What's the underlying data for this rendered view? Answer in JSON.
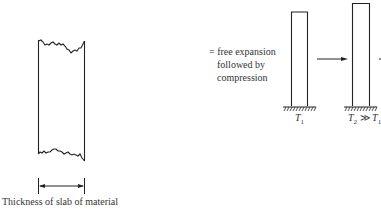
{
  "figure": {
    "slab_caption": "Thickness of slab of material",
    "description_lines": [
      "= free expansion",
      "followed by",
      "compression"
    ],
    "column1_label": {
      "base": "T",
      "sub": "1"
    },
    "column2_label": {
      "base": "T",
      "sub": "2",
      "relation": " ≫ ",
      "base2": "T",
      "sub2": "1"
    },
    "colors": {
      "line": "#222222",
      "background": "#ffffff"
    }
  }
}
